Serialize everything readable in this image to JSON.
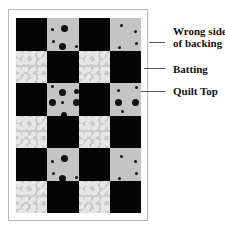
{
  "diagram": {
    "type": "quilt-layers",
    "grid": {
      "columns": 4,
      "rows": 6,
      "pattern": [
        [
          "black",
          "dots",
          "black",
          "dots"
        ],
        [
          "bubbles",
          "black",
          "bubbles",
          "black"
        ],
        [
          "black",
          "dots",
          "black",
          "dots"
        ],
        [
          "bubbles",
          "black",
          "bubbles",
          "black"
        ],
        [
          "black",
          "dots",
          "black",
          "dots"
        ],
        [
          "bubbles",
          "black",
          "bubbles",
          "black"
        ]
      ]
    },
    "labels": [
      {
        "id": "backing",
        "line1": "Wrong side",
        "line2": "of backing"
      },
      {
        "id": "batting",
        "line1": "Batting"
      },
      {
        "id": "quilt-top",
        "line1": "Quilt Top"
      }
    ],
    "colors": {
      "black": "#050505",
      "dots_bg": "#c4c4c4",
      "bubbles_bg": "#c9c9c9",
      "frame": "#b8b8b8"
    }
  }
}
